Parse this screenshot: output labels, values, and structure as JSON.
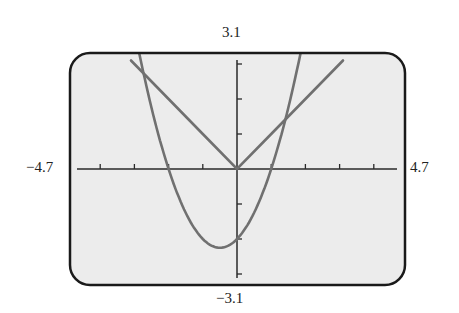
{
  "window_labels": {
    "ymax": "3.1",
    "ymin": "−3.1",
    "xmin": "−4.7",
    "xmax": "4.7"
  },
  "colors": {
    "screen_bg": "#ececec",
    "frame": "#1a1a1a",
    "axes": "#2a2a2a",
    "curve": "#707070"
  },
  "chart_data": {
    "type": "line",
    "title": "",
    "xlabel": "",
    "ylabel": "",
    "xlim": [
      -4.7,
      4.7
    ],
    "ylim": [
      -3.1,
      3.1
    ],
    "x_tick_step": 1,
    "y_tick_step": 1,
    "grid": false,
    "legend": null,
    "series": [
      {
        "name": "y = |x|",
        "x": [
          -3.1,
          -2,
          -1,
          0,
          1,
          2,
          3.1
        ],
        "y": [
          3.1,
          2,
          1,
          0,
          1,
          2,
          3.1
        ]
      },
      {
        "name": "y = x^2 + x - 2",
        "x": [
          -3.0,
          -2.5,
          -2,
          -1.5,
          -1,
          -0.5,
          0,
          0.5,
          1,
          1.5,
          2.0
        ],
        "y": [
          4.0,
          1.75,
          0,
          -1.25,
          -2,
          -2.25,
          -2,
          -1.25,
          0,
          1.75,
          4.0
        ]
      }
    ],
    "annotations": [
      "3.1",
      "-3.1",
      "-4.7",
      "4.7"
    ]
  }
}
